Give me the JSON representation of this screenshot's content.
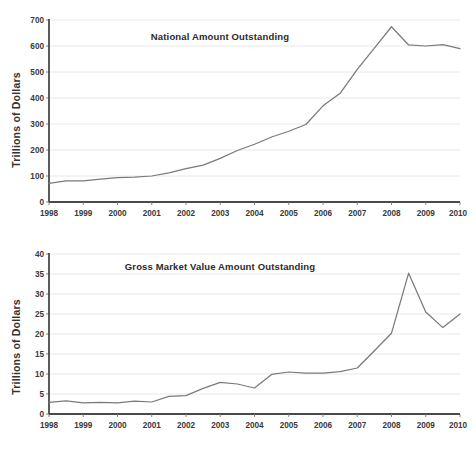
{
  "figure": {
    "background_color": "#ffffff",
    "line_color": "#7a7a7a",
    "grid_color": "#e2e2e2",
    "axis_color": "#555555"
  },
  "chart_data": [
    {
      "type": "line",
      "id": "national-amount-outstanding",
      "title": "National Amount Outstanding",
      "xlabel": "",
      "ylabel": "Trillions of Dollars",
      "xlim": [
        1998,
        2010
      ],
      "ylim": [
        0,
        700
      ],
      "grid": true,
      "legend": "none",
      "xticks": [
        "1998",
        "1999",
        "2000",
        "2001",
        "2002",
        "2003",
        "2004",
        "2005",
        "2006",
        "2007",
        "2008",
        "2009",
        "2010"
      ],
      "yticks": [
        "0",
        "100",
        "200",
        "300",
        "400",
        "500",
        "600",
        "700"
      ],
      "series": [
        {
          "name": "Notional Amount Outstanding",
          "x": [
            1998.0,
            1998.5,
            1999.0,
            1999.5,
            2000.0,
            2000.5,
            2001.0,
            2001.5,
            2002.0,
            2002.5,
            2003.0,
            2003.5,
            2004.0,
            2004.5,
            2005.0,
            2005.5,
            2006.0,
            2006.5,
            2007.0,
            2007.5,
            2008.0,
            2008.5,
            2009.0,
            2009.5,
            2010.0
          ],
          "values": [
            72,
            81,
            81,
            88,
            94,
            96,
            100,
            112,
            128,
            142,
            168,
            198,
            222,
            250,
            272,
            298,
            370,
            418,
            510,
            592,
            674,
            604,
            600,
            605,
            590
          ]
        }
      ]
    },
    {
      "type": "line",
      "id": "gross-market-value-amount-outstanding",
      "title": "Gross Market Value Amount Outstanding",
      "xlabel": "",
      "ylabel": "Trillions of Dollars",
      "xlim": [
        1998,
        2010
      ],
      "ylim": [
        0,
        40
      ],
      "grid": true,
      "legend": "none",
      "xticks": [
        "1998",
        "1999",
        "2000",
        "2001",
        "2002",
        "2003",
        "2004",
        "2005",
        "2006",
        "2007",
        "2008",
        "2009",
        "2010"
      ],
      "yticks": [
        "0",
        "5",
        "10",
        "15",
        "20",
        "25",
        "30",
        "35",
        "40"
      ],
      "series": [
        {
          "name": "Gross Market Value Amount Outstanding",
          "x": [
            1998.0,
            1998.5,
            1999.0,
            1999.5,
            2000.0,
            2000.5,
            2001.0,
            2001.5,
            2002.0,
            2002.5,
            2003.0,
            2003.5,
            2004.0,
            2004.5,
            2005.0,
            2005.5,
            2006.0,
            2006.5,
            2007.0,
            2007.5,
            2008.0,
            2008.5,
            2009.0,
            2009.5,
            2010.0
          ],
          "values": [
            2.9,
            3.3,
            2.8,
            2.9,
            2.8,
            3.2,
            3.0,
            4.4,
            4.6,
            6.4,
            7.9,
            7.5,
            6.5,
            9.9,
            10.5,
            10.2,
            10.2,
            10.6,
            11.5,
            15.8,
            20.2,
            35.2,
            25.5,
            21.6,
            25.0
          ]
        }
      ]
    }
  ]
}
